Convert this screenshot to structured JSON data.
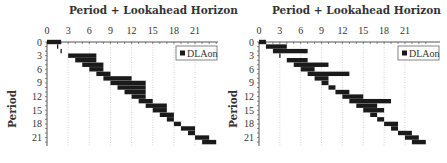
{
  "chart_data": [
    {
      "type": "bar",
      "subtype": "gantt-horizontal",
      "title": "Period + Lookahead Horizon",
      "xlabel": "Period + Lookahead Horizon",
      "ylabel": "Period",
      "x_ticks": [
        0,
        3,
        6,
        9,
        12,
        15,
        18,
        21
      ],
      "y_ticks": [
        0,
        3,
        6,
        9,
        12,
        15,
        18,
        21
      ],
      "xlim": [
        0,
        24
      ],
      "ylim": [
        0,
        22
      ],
      "grid": "vertical-dotted",
      "legend": {
        "entries": [
          "DLAon"
        ],
        "position": "upper-right"
      },
      "series": [
        {
          "name": "DLAon",
          "bars": [
            {
              "period": 0,
              "start": 0,
              "end": 2
            },
            {
              "period": 1,
              "start": 1.5,
              "end": 1.5
            },
            {
              "period": 2,
              "start": 2,
              "end": 2
            },
            {
              "period": 3,
              "start": 3,
              "end": 7
            },
            {
              "period": 4,
              "start": 4,
              "end": 7
            },
            {
              "period": 5,
              "start": 5,
              "end": 8
            },
            {
              "period": 6,
              "start": 6,
              "end": 8
            },
            {
              "period": 7,
              "start": 7,
              "end": 9
            },
            {
              "period": 8,
              "start": 8,
              "end": 12
            },
            {
              "period": 9,
              "start": 9,
              "end": 14
            },
            {
              "period": 10,
              "start": 10,
              "end": 14
            },
            {
              "period": 11,
              "start": 11,
              "end": 14
            },
            {
              "period": 12,
              "start": 12,
              "end": 14
            },
            {
              "period": 13,
              "start": 13,
              "end": 15
            },
            {
              "period": 14,
              "start": 14,
              "end": 17
            },
            {
              "period": 15,
              "start": 15,
              "end": 17
            },
            {
              "period": 16,
              "start": 16,
              "end": 18
            },
            {
              "period": 17,
              "start": 17,
              "end": 18
            },
            {
              "period": 18,
              "start": 18,
              "end": 19
            },
            {
              "period": 19,
              "start": 19,
              "end": 21
            },
            {
              "period": 20,
              "start": 20,
              "end": 21
            },
            {
              "period": 21,
              "start": 21,
              "end": 23
            },
            {
              "period": 22,
              "start": 22,
              "end": 24
            }
          ]
        }
      ]
    },
    {
      "type": "bar",
      "subtype": "gantt-horizontal",
      "title": "Period + Lookahead Horizon",
      "xlabel": "Period + Lookahead Horizon",
      "ylabel": "Period",
      "x_ticks": [
        0,
        3,
        6,
        9,
        12,
        15,
        18,
        21
      ],
      "y_ticks": [
        0,
        3,
        6,
        9,
        12,
        15,
        18,
        21
      ],
      "xlim": [
        0,
        24
      ],
      "ylim": [
        0,
        22
      ],
      "grid": "vertical-dotted",
      "legend": {
        "entries": [
          "DLAon"
        ],
        "position": "upper-right"
      },
      "series": [
        {
          "name": "DLAon",
          "bars": [
            {
              "period": 0,
              "start": 0,
              "end": 1
            },
            {
              "period": 1,
              "start": 1,
              "end": 4
            },
            {
              "period": 2,
              "start": 2,
              "end": 7
            },
            {
              "period": 3,
              "start": 3,
              "end": 3
            },
            {
              "period": 4,
              "start": 4,
              "end": 7
            },
            {
              "period": 5,
              "start": 5,
              "end": 10
            },
            {
              "period": 6,
              "start": 6,
              "end": 8
            },
            {
              "period": 7,
              "start": 7,
              "end": 13
            },
            {
              "period": 8,
              "start": 8,
              "end": 10
            },
            {
              "period": 9,
              "start": 9,
              "end": 10
            },
            {
              "period": 10,
              "start": 10,
              "end": 11
            },
            {
              "period": 11,
              "start": 11,
              "end": 13
            },
            {
              "period": 12,
              "start": 12,
              "end": 15
            },
            {
              "period": 13,
              "start": 13,
              "end": 19
            },
            {
              "period": 14,
              "start": 14,
              "end": 17
            },
            {
              "period": 15,
              "start": 15,
              "end": 18
            },
            {
              "period": 16,
              "start": 16,
              "end": 17
            },
            {
              "period": 17,
              "start": 17,
              "end": 18
            },
            {
              "period": 18,
              "start": 18,
              "end": 20
            },
            {
              "period": 19,
              "start": 19,
              "end": 20
            },
            {
              "period": 20,
              "start": 20,
              "end": 22
            },
            {
              "period": 21,
              "start": 21,
              "end": 23
            },
            {
              "period": 22,
              "start": 22,
              "end": 24
            }
          ]
        }
      ]
    }
  ],
  "charts": [
    {
      "title": "Period + Lookahead Horizon",
      "ylabel": "Period",
      "legend_label": "DLAon"
    },
    {
      "title": "Period + Lookahead Horizon",
      "ylabel": "Period",
      "legend_label": "DLAon"
    }
  ],
  "colors": {
    "bar": "#1a1a1a",
    "grid": "#c8c8c8",
    "axis": "#555555",
    "text": "#333333"
  }
}
